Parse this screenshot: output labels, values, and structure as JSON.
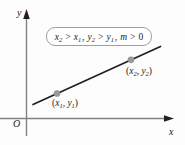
{
  "figure": {
    "type": "coordinate-plane-line-graph",
    "background_color": "#fdfdfd",
    "axes": {
      "x_label": "x",
      "y_label": "y",
      "origin_label": "O",
      "axis_color": "#808285",
      "arrow_color": "#231f20"
    },
    "line": {
      "color": "#231f20",
      "description": "straight line with positive slope",
      "start": {
        "x": 33,
        "y": 104
      },
      "end": {
        "x": 160,
        "y": 47
      }
    },
    "points": [
      {
        "name": "point1",
        "label_parts": {
          "open": "(",
          "x_var": "x",
          "x_sub": "1",
          "comma": ", ",
          "y_var": "y",
          "y_sub": "1",
          "close": ")"
        },
        "label_text": "(x₁, y₁)",
        "marker_color": "#9a9a9a",
        "cx": 57,
        "cy": 92
      },
      {
        "name": "point2",
        "label_parts": {
          "open": "(",
          "x_var": "x",
          "x_sub": "2",
          "comma": ", ",
          "y_var": "y",
          "y_sub": "2",
          "close": ")"
        },
        "label_text": "(x₂, y₂)",
        "marker_color": "#9a9a9a",
        "cx": 131,
        "cy": 60
      }
    ],
    "condition_box": {
      "border_color": "#9aa0a6",
      "fill_color": "#ffffff",
      "text": "x₂ > x₁, y₂ > y₁, m > 0",
      "parts": {
        "x2": "x",
        "x2_sub": "2",
        "gt1": " > ",
        "x1": "x",
        "x1_sub": "1",
        "sep1": ", ",
        "y2": "y",
        "y2_sub": "2",
        "gt2": " > ",
        "y1": "y",
        "y1_sub": "1",
        "sep2": ", ",
        "m": "m",
        "gt3": " > ",
        "zero": "0"
      }
    }
  }
}
